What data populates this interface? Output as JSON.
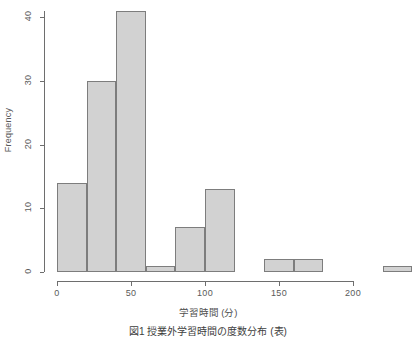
{
  "chart_data": {
    "type": "bar",
    "title": "",
    "subtitle": "",
    "xlabel": "学習時間 (分)",
    "ylabel": "Frequency",
    "xlim": [
      0,
      240
    ],
    "ylim": [
      0,
      41
    ],
    "grid": false,
    "legend": "none",
    "bin_width": 20,
    "bin_edges": [
      0,
      20,
      40,
      60,
      80,
      100,
      120,
      140,
      160,
      180,
      200,
      220,
      240
    ],
    "categories": [
      "0-20",
      "20-40",
      "40-60",
      "60-80",
      "80-100",
      "100-120",
      "120-140",
      "140-160",
      "160-180",
      "180-200",
      "200-220",
      "220-240"
    ],
    "values": [
      14,
      30,
      41,
      1,
      7,
      13,
      0,
      2,
      2,
      0,
      0,
      1
    ],
    "x_ticks": [
      0,
      50,
      100,
      150,
      200
    ],
    "x_tick_labels": [
      "0",
      "50",
      "100",
      "150",
      "200"
    ],
    "y_ticks": [
      0,
      10,
      20,
      30,
      40
    ],
    "y_tick_labels": [
      "0",
      "10",
      "20",
      "30",
      "40"
    ],
    "bar_fill_color": "#d2d2d2",
    "bar_border_color": "#7d7d7d",
    "axis_color": "#6e6e6e"
  },
  "caption": {
    "text": "図1 授業外学習時間の度数分布 (表)"
  }
}
